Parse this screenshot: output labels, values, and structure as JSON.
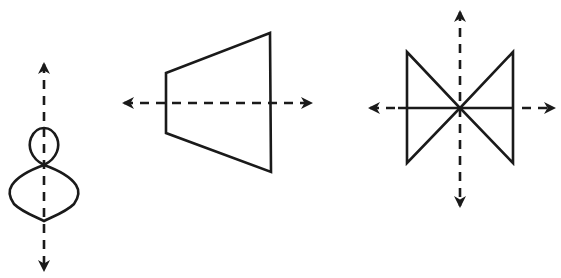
{
  "diagram": {
    "colors": {
      "stroke": "#1a1a1a",
      "background": "#ffffff"
    },
    "figures": [
      {
        "id": "figure-1",
        "shape": "figure-eight (two stacked teardrop lobes, small on top, large below)",
        "symmetry_axes": [
          "vertical"
        ]
      },
      {
        "id": "figure-2",
        "shape": "isosceles trapezoid opening to the right",
        "symmetry_axes": [
          "horizontal"
        ]
      },
      {
        "id": "figure-3",
        "shape": "bowtie (two triangles meeting at a center point) with a horizontal midline",
        "symmetry_axes": [
          "vertical",
          "horizontal"
        ]
      }
    ]
  }
}
